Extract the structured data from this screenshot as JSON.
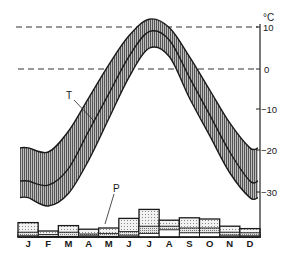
{
  "chart_data": {
    "type": "line",
    "title": "",
    "xlabel": "",
    "ylabel": "°C",
    "categories": [
      "J",
      "F",
      "M",
      "A",
      "M",
      "J",
      "J",
      "A",
      "S",
      "O",
      "N",
      "D"
    ],
    "ylim": [
      -33,
      13
    ],
    "yticks": [
      10,
      0,
      -10,
      -20,
      -30
    ],
    "reference_lines": [
      10,
      0
    ],
    "temperature": {
      "label": "T",
      "series": [
        {
          "name": "mean maximum",
          "values": [
            -19,
            -20,
            -15,
            -7,
            1,
            8,
            12,
            10,
            3,
            -5,
            -13,
            -19
          ]
        },
        {
          "name": "mean",
          "values": [
            -27,
            -28,
            -24,
            -15,
            -6,
            3,
            9,
            7,
            -2,
            -11,
            -20,
            -27
          ]
        },
        {
          "name": "mean minimum",
          "values": [
            -31,
            -33,
            -30,
            -22,
            -12,
            -2,
            5,
            3,
            -7,
            -16,
            -25,
            -31
          ]
        }
      ]
    },
    "precipitation": {
      "label": "P",
      "series": [
        {
          "name": "total",
          "values": [
            24,
            10,
            19,
            13,
            15,
            31,
            46,
            28,
            32,
            30,
            18,
            14
          ]
        },
        {
          "name": "layer 2",
          "values": [
            8,
            4,
            8,
            5,
            6,
            9,
            18,
            18,
            15,
            15,
            8,
            7
          ]
        },
        {
          "name": "layer 3",
          "values": [
            2,
            1,
            1,
            2,
            1,
            3,
            6,
            12,
            7,
            7,
            3,
            2
          ]
        }
      ]
    },
    "labels": {
      "unit": "°C",
      "T": "T",
      "P": "P",
      "ticks": [
        "10",
        "0",
        "−10",
        "−20",
        "−30"
      ]
    },
    "colors": {
      "line": "#1a1a1a",
      "band": "#9a9a9a",
      "dots": "#d9d9d9",
      "background": "#ffffff"
    }
  }
}
